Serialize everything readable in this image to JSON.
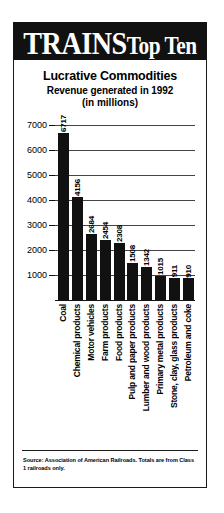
{
  "masthead": {
    "brand": "TRAINS",
    "suffix": "Top Ten",
    "background_color": "#111111",
    "text_color": "#ffffff"
  },
  "headings": {
    "title": "Lucrative Commodities",
    "subtitle": "Revenue generated in 1992",
    "units": "(in millions)"
  },
  "source": {
    "note": "Source: Association of American Railroads. Totals are from Class 1 railroads only."
  },
  "chart_data": {
    "type": "bar",
    "title": "Lucrative Commodities",
    "subtitle": "Revenue generated in 1992",
    "xlabel": "",
    "ylabel": "(in millions)",
    "ylim": [
      0,
      7400
    ],
    "yticks": [
      1000,
      2000,
      3000,
      4000,
      5000,
      6000,
      7000
    ],
    "ytick_labels": [
      "1000",
      "2000",
      "3000",
      "4000",
      "5000",
      "6000",
      "7000"
    ],
    "grid": true,
    "legend": false,
    "bar_color": "#111111",
    "categories": [
      "Coal",
      "Chemical products",
      "Motor vehicles",
      "Farm products",
      "Food products",
      "Pulp and paper products",
      "Lumber and wood products",
      "Primary metal products",
      "Stone, clay, glass products",
      "Petroleum and coke"
    ],
    "values": [
      6717,
      4156,
      2684,
      2454,
      2308,
      1508,
      1342,
      1015,
      911,
      910
    ],
    "value_labels": [
      "6717",
      "4156",
      "2684",
      "2454",
      "2308",
      "1508",
      "1342",
      "1015",
      "911",
      "910"
    ]
  }
}
